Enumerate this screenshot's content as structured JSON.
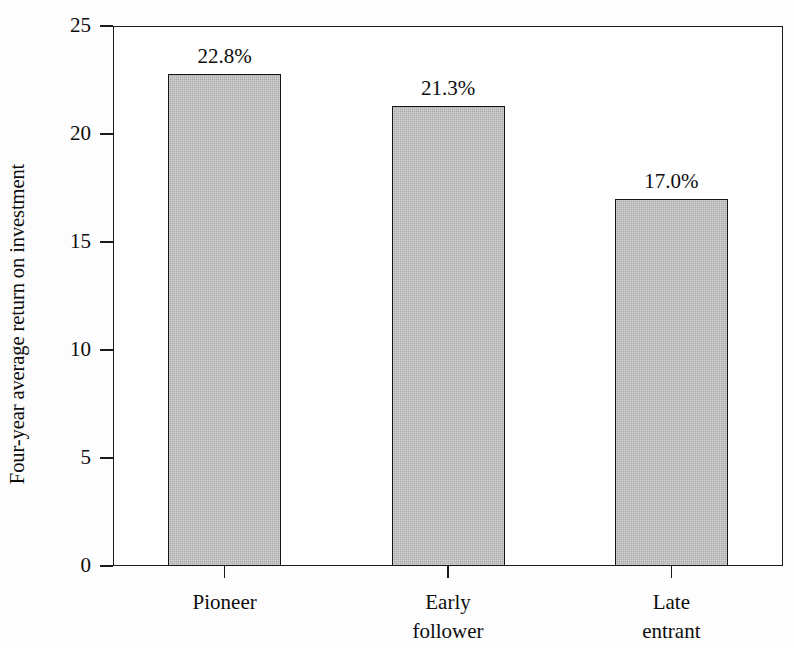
{
  "chart_data": {
    "type": "bar",
    "title": "",
    "subtitle": "",
    "xlabel": "",
    "ylabel": "Four-year average return on investment",
    "categories": [
      "Pioneer",
      "Early follower",
      "Late entrant"
    ],
    "category_lines": [
      [
        "Pioneer"
      ],
      [
        "Early",
        "follower"
      ],
      [
        "Late",
        "entrant"
      ]
    ],
    "values": [
      22.8,
      21.3,
      17.0
    ],
    "data_labels": [
      "22.8%",
      "21.3%",
      "17.0%"
    ],
    "ylim": [
      0,
      25
    ],
    "ytick_values": [
      0,
      5,
      10,
      15,
      20,
      25
    ],
    "ytick_labels": [
      "0",
      "5",
      "10",
      "15",
      "20",
      "25"
    ],
    "grid": false,
    "legend": null,
    "legend_position": "none",
    "bar_fill_color": "#a9a9a9",
    "bar_edge_color": "#151515",
    "axis_color": "#1a1a1a",
    "background_color": "#ffffff",
    "text_color": "#0d0d0d"
  },
  "axis": {
    "y_title": "Four-year average return on investment",
    "ticks": [
      {
        "label": "25",
        "value": 25
      },
      {
        "label": "20",
        "value": 20
      },
      {
        "label": "15",
        "value": 15
      },
      {
        "label": "10",
        "value": 10
      },
      {
        "label": "5",
        "value": 5
      },
      {
        "label": "0",
        "value": 0
      }
    ]
  },
  "bars": [
    {
      "category": "Pioneer",
      "label_line1": "Pioneer",
      "label_line2": "",
      "value": 22.8,
      "value_label": "22.8%"
    },
    {
      "category": "Early follower",
      "label_line1": "Early",
      "label_line2": "follower",
      "value": 21.3,
      "value_label": "21.3%"
    },
    {
      "category": "Late entrant",
      "label_line1": "Late",
      "label_line2": "entrant",
      "value": 17.0,
      "value_label": "17.0%"
    }
  ]
}
